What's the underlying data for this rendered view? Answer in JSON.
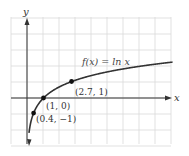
{
  "chart_data": {
    "type": "line",
    "title": "",
    "function_label": "f(x) = ln x",
    "xlabel": "x",
    "ylabel": "y",
    "grid": true,
    "xlim": [
      -1,
      9
    ],
    "ylim": [
      -3,
      5
    ],
    "series": [
      {
        "name": "f(x) = ln x",
        "function": "ln x",
        "x": [
          0.05,
          0.1,
          0.2,
          0.4,
          0.6,
          1,
          1.5,
          2,
          2.7,
          3.5,
          4.5,
          5.5,
          6.5,
          7.5,
          8.8
        ],
        "values": [
          -3.0,
          -2.3,
          -1.61,
          -0.92,
          -0.51,
          0,
          0.41,
          0.69,
          1.0,
          1.25,
          1.5,
          1.7,
          1.87,
          2.01,
          2.17
        ]
      }
    ],
    "annotations": [
      {
        "label": "(0.4, −1)",
        "x": 0.4,
        "y": -1
      },
      {
        "label": "(1, 0)",
        "x": 1,
        "y": 0
      },
      {
        "label": "(2.7, 1)",
        "x": 2.7,
        "y": 1
      }
    ]
  },
  "colors": {
    "grid": "#d9d9d9",
    "axis": "#333333",
    "curve": "#333333",
    "point": "#111111",
    "text": "#333333"
  }
}
